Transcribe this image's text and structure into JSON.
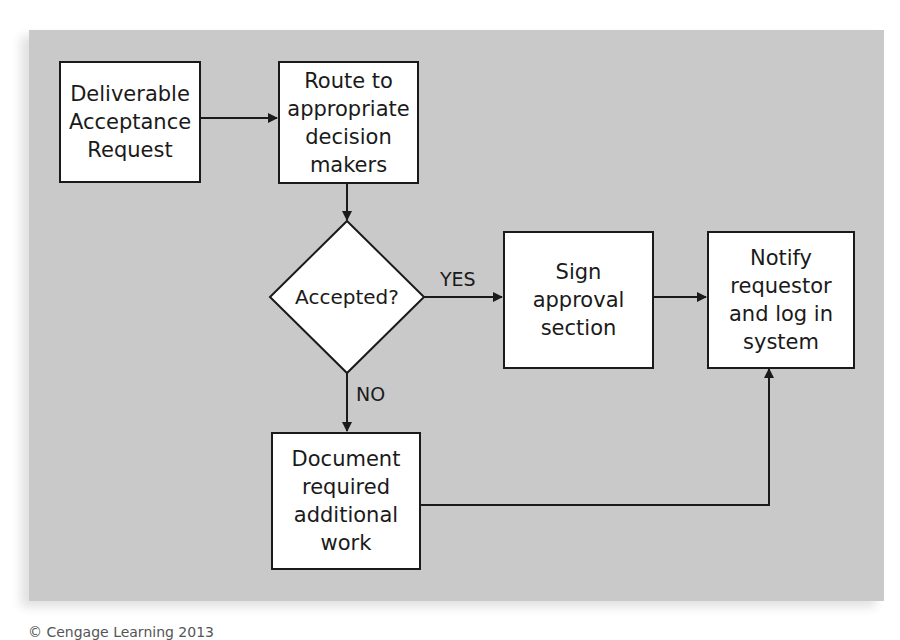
{
  "diagram": {
    "type": "flowchart",
    "background_color": "#c9c9c9",
    "nodes": {
      "deliverable_request": {
        "shape": "rectangle",
        "label": "Deliverable\nAcceptance\nRequest"
      },
      "route_to_decision_makers": {
        "shape": "rectangle",
        "label": "Route to\nappropriate\ndecision\nmakers"
      },
      "accepted_decision": {
        "shape": "diamond",
        "label": "Accepted?"
      },
      "sign_approval": {
        "shape": "rectangle",
        "label": "Sign\napproval\nsection"
      },
      "notify_and_log": {
        "shape": "rectangle",
        "label": "Notify\nrequestor\nand log in\nsystem"
      },
      "document_additional_work": {
        "shape": "rectangle",
        "label": "Document\nrequired\nadditional\nwork"
      }
    },
    "edges": [
      {
        "from": "deliverable_request",
        "to": "route_to_decision_makers",
        "label": ""
      },
      {
        "from": "route_to_decision_makers",
        "to": "accepted_decision",
        "label": ""
      },
      {
        "from": "accepted_decision",
        "to": "sign_approval",
        "label": "YES"
      },
      {
        "from": "accepted_decision",
        "to": "document_additional_work",
        "label": "NO"
      },
      {
        "from": "sign_approval",
        "to": "notify_and_log",
        "label": ""
      },
      {
        "from": "document_additional_work",
        "to": "notify_and_log",
        "label": ""
      }
    ],
    "edge_labels": {
      "yes": "YES",
      "no": "NO"
    }
  },
  "footer": {
    "credit": "© Cengage Learning 2013"
  }
}
